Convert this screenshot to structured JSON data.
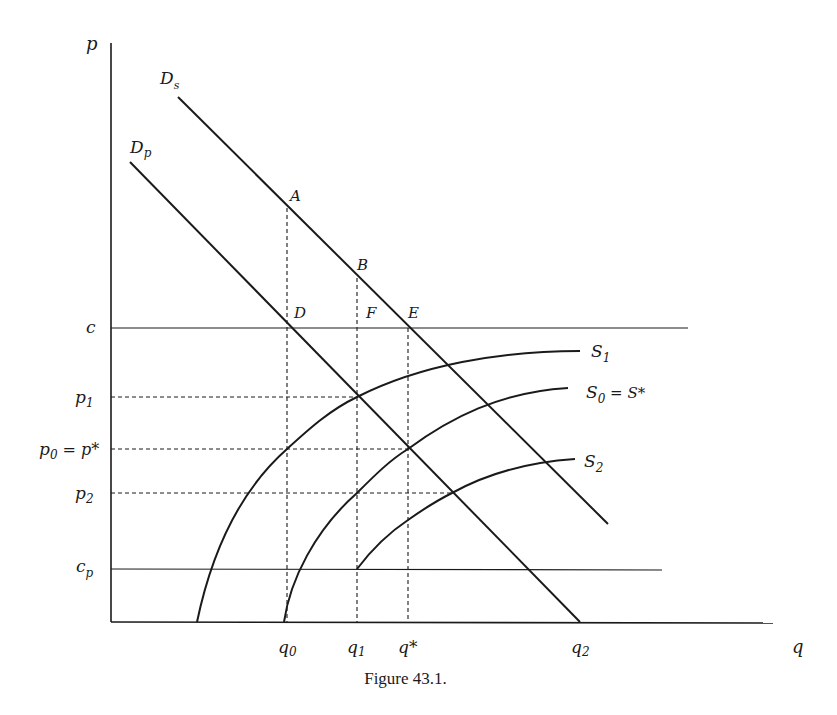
{
  "figure": {
    "caption": "Figure 43.1.",
    "axes": {
      "y_label": "p",
      "x_label": "q"
    },
    "price_levels": [
      {
        "id": "c",
        "label": "c",
        "line": "solid"
      },
      {
        "id": "p1",
        "label": "p",
        "sub": "1",
        "line": "dashed"
      },
      {
        "id": "p0",
        "label": "p",
        "sub": "0",
        "extra": " = p*",
        "line": "dashed"
      },
      {
        "id": "p2",
        "label": "p",
        "sub": "2",
        "line": "dashed"
      },
      {
        "id": "cp",
        "label": "c",
        "sub": "p",
        "line": "solid"
      }
    ],
    "quantity_levels": [
      {
        "id": "q0",
        "label": "q",
        "sub": "0"
      },
      {
        "id": "q1",
        "label": "q",
        "sub": "1"
      },
      {
        "id": "qstar",
        "label": "q*"
      },
      {
        "id": "q2",
        "label": "q",
        "sub": "2"
      }
    ],
    "curves": {
      "Ds": {
        "label": "D",
        "sub": "s",
        "description": "social demand"
      },
      "Dp": {
        "label": "D",
        "sub": "p",
        "description": "private demand"
      },
      "S1": {
        "label": "S",
        "sub": "1"
      },
      "S0": {
        "label": "S",
        "sub": "0",
        "extra": " = S*"
      },
      "S2": {
        "label": "S",
        "sub": "2"
      }
    },
    "points": {
      "A": "A",
      "B": "B",
      "D": "D",
      "E": "E",
      "F": "F"
    }
  }
}
